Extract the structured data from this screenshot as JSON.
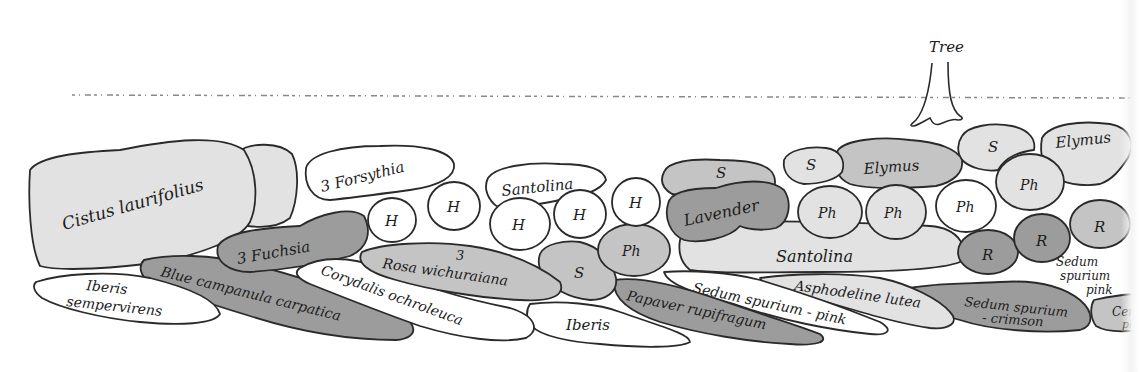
{
  "diagram": {
    "type": "garden planting plan",
    "colors": {
      "background": "#ffffff",
      "outline": "#2a2a2a",
      "white_fill": "#ffffff",
      "light_grey": "#e2e2e2",
      "mid_grey": "#c4c4c4",
      "dark_grey": "#9c9c9c"
    },
    "boundary": {
      "label": "",
      "style": "dotted line"
    },
    "tree": {
      "label": "Tree"
    },
    "plants": [
      {
        "id": "cistus",
        "label": "Cistus laurifolius",
        "shade": "light_grey"
      },
      {
        "id": "cistus-2",
        "label": "",
        "shade": "light_grey"
      },
      {
        "id": "forsythia",
        "label": "3 Forsythia",
        "shade": "white_fill"
      },
      {
        "id": "fuchsia",
        "label": "3 Fuchsia",
        "shade": "dark_grey"
      },
      {
        "id": "h1",
        "label": "H",
        "shade": "white_fill"
      },
      {
        "id": "h2",
        "label": "H",
        "shade": "white_fill"
      },
      {
        "id": "santolina-1",
        "label": "Santolina",
        "shade": "white_fill"
      },
      {
        "id": "h3",
        "label": "H",
        "shade": "white_fill"
      },
      {
        "id": "h4",
        "label": "H",
        "shade": "white_fill"
      },
      {
        "id": "h5",
        "label": "H",
        "shade": "white_fill"
      },
      {
        "id": "iberis-1",
        "label": "Iberis sempervirens",
        "shade": "white_fill"
      },
      {
        "id": "campanula",
        "label": "Blue campanula carpatica",
        "shade": "dark_grey"
      },
      {
        "id": "corydalis",
        "label": "Corydalis ochroleuca",
        "shade": "white_fill"
      },
      {
        "id": "rosa",
        "label": "3 Rosa wichuraiana",
        "shade": "mid_grey"
      },
      {
        "id": "s1",
        "label": "S",
        "shade": "mid_grey"
      },
      {
        "id": "ph1",
        "label": "Ph",
        "shade": "mid_grey"
      },
      {
        "id": "iberis-2",
        "label": "Iberis",
        "shade": "white_fill"
      },
      {
        "id": "papaver",
        "label": "Papaver rupifragum",
        "shade": "dark_grey"
      },
      {
        "id": "s2",
        "label": "S",
        "shade": "mid_grey"
      },
      {
        "id": "lavender",
        "label": "Lavender",
        "shade": "dark_grey"
      },
      {
        "id": "santolina-2",
        "label": "Santolina",
        "shade": "light_grey"
      },
      {
        "id": "sedum-pink-1",
        "label": "Sedum spurium - pink",
        "shade": "white_fill"
      },
      {
        "id": "asphodeline",
        "label": "Asphodeline lutea",
        "shade": "light_grey"
      },
      {
        "id": "s3",
        "label": "S",
        "shade": "light_grey"
      },
      {
        "id": "elymus-1",
        "label": "Elymus",
        "shade": "mid_grey"
      },
      {
        "id": "ph2",
        "label": "Ph",
        "shade": "light_grey"
      },
      {
        "id": "ph3",
        "label": "Ph",
        "shade": "light_grey"
      },
      {
        "id": "s4",
        "label": "S",
        "shade": "light_grey"
      },
      {
        "id": "elymus-2",
        "label": "Elymus",
        "shade": "light_grey"
      },
      {
        "id": "ph4",
        "label": "Ph",
        "shade": "white_fill"
      },
      {
        "id": "ph5",
        "label": "Ph",
        "shade": "light_grey"
      },
      {
        "id": "r1",
        "label": "R",
        "shade": "dark_grey"
      },
      {
        "id": "r2",
        "label": "R",
        "shade": "dark_grey"
      },
      {
        "id": "r3",
        "label": "R",
        "shade": "mid_grey"
      },
      {
        "id": "sedum-pink-2",
        "label": "Sedum spurium pink",
        "shade": "light_grey"
      },
      {
        "id": "sedum-crimson",
        "label": "Sedum spurium - crimson",
        "shade": "dark_grey"
      },
      {
        "id": "cut-off",
        "label": "Cer pl",
        "shade": "mid_grey"
      }
    ],
    "labels": {
      "tree": "Tree",
      "cistus": "Cistus laurifolius",
      "forsythia": "3 Forsythia",
      "fuchsia": "3 Fuchsia",
      "h": "H",
      "santolina": "Santolina",
      "iberis_1a": "Iberis",
      "iberis_1b": "sempervirens",
      "campanula": "Blue campanula carpatica",
      "corydalis": "Corydalis ochroleuca",
      "rosa_n": "3",
      "rosa": "Rosa wichuraiana",
      "s": "S",
      "ph": "Ph",
      "iberis_2": "Iberis",
      "papaver": "Papaver rupifragum",
      "lavender": "Lavender",
      "santolina_2": "Santolina",
      "sedum_pink_1": "Sedum spurium - pink",
      "asphodeline": "Asphodeline lutea",
      "elymus": "Elymus",
      "r": "R",
      "sedum_2a": "Sedum",
      "sedum_2b": "spurium",
      "sedum_2c": "pink",
      "sedum_crimson_a": "Sedum spurium",
      "sedum_crimson_b": "- crimson",
      "cut_a": "Cer",
      "cut_b": "pl"
    }
  }
}
